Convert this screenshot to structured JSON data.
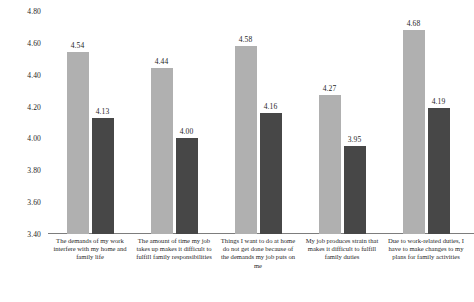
{
  "chart_data": {
    "type": "bar",
    "title": "",
    "subtitle": "",
    "xlabel": "",
    "ylabel": "",
    "ylim": [
      3.4,
      4.8
    ],
    "yticks": [
      "4.80",
      "4.60",
      "4.40",
      "4.20",
      "4.00",
      "3.80",
      "3.60",
      "3.40"
    ],
    "grid": false,
    "legend_position": "none",
    "categories": [
      "The demands of my work interfere with my home and family life",
      "The amount of time my job takes up makes it difficult to fulfill family responsibilities",
      "Things I want to do at home do not get done because of the demands my job puts on me",
      "My job produces strain that makes it difficult to fulfill family duties",
      "Due to work-related duties, I have to make changes to my plans for family activities"
    ],
    "series": [
      {
        "name": "Series 1",
        "color": "#b0b0b0",
        "values": [
          4.54,
          4.44,
          4.58,
          4.27,
          4.68
        ],
        "labels": [
          "4.54",
          "4.44",
          "4.58",
          "4.27",
          "4.68"
        ]
      },
      {
        "name": "Series 2",
        "color": "#474747",
        "values": [
          4.13,
          4.0,
          4.16,
          3.95,
          4.19
        ],
        "labels": [
          "4.13",
          "4.00",
          "4.16",
          "3.95",
          "4.19"
        ]
      }
    ]
  },
  "footer": {
    "cut_off_line": ""
  }
}
